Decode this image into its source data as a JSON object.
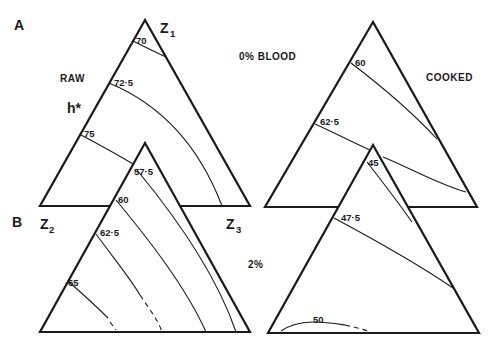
{
  "figure": {
    "panel_a_label": "A",
    "panel_b_label": "B",
    "raw_label": "RAW",
    "cooked_label": "COOKED",
    "blood_a_label": "0% BLOOD",
    "blood_b_label": "2%",
    "axis_label": "h*",
    "vertices": {
      "top": "Z",
      "top_sub": "1",
      "left": "Z",
      "left_sub": "2",
      "right": "Z",
      "right_sub": "3"
    }
  },
  "panels": [
    {
      "id": "A-raw",
      "contours": [
        "70",
        "72·5",
        "75"
      ]
    },
    {
      "id": "A-cooked",
      "contours": [
        "60",
        "62·5"
      ]
    },
    {
      "id": "B-raw",
      "contours": [
        "57·5",
        "60",
        "62·5",
        "65"
      ]
    },
    {
      "id": "B-cooked",
      "contours": [
        "45",
        "47·5",
        "50"
      ]
    }
  ],
  "colors": {
    "ink": "#1a1a1a",
    "background": "#ffffff"
  }
}
